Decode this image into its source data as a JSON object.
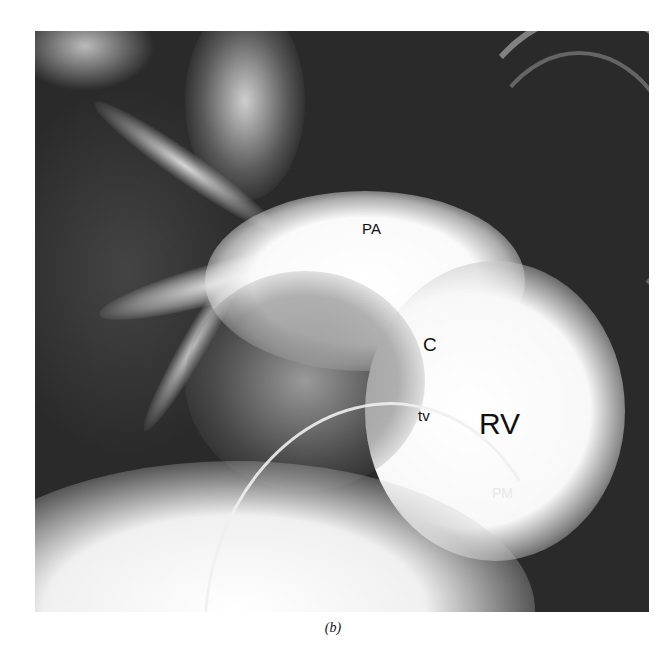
{
  "figure": {
    "labels": {
      "pa": "PA",
      "c": "C",
      "tv": "tv",
      "rv": "RV",
      "pm": "PM"
    },
    "caption": "(b)"
  }
}
